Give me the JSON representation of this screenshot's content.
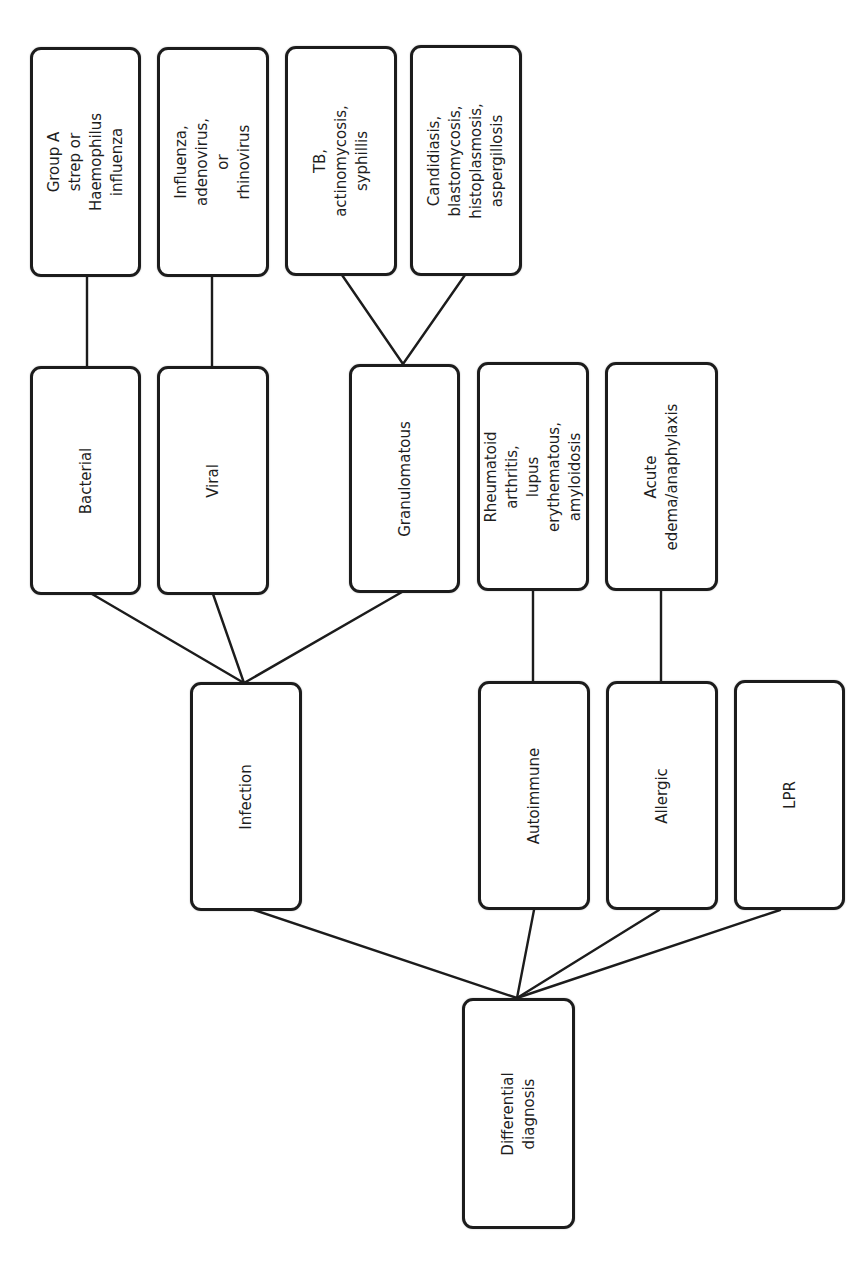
{
  "diagram": {
    "type": "tree",
    "orientation": "rotated 90° counter-clockwise; root at bottom, leaves at top, text reads bottom-to-top",
    "root": {
      "label": "Differential diagnosis",
      "children": [
        {
          "label": "Infection",
          "children": [
            {
              "label": "Bacterial",
              "children": [
                {
                  "label": "Group A strep or\nHaemophilus influenza"
                }
              ]
            },
            {
              "label": "Viral",
              "children": [
                {
                  "label": "Influenza, adenovirus,\nor rhinovirus"
                }
              ]
            },
            {
              "label": "Granulomatous",
              "children": [
                {
                  "label": "TB, actinomycosis,\nsyphillis"
                },
                {
                  "label": "Candidiasis,\nblastomycosis,\nhistoplasmosis,\naspergillosis"
                }
              ]
            }
          ]
        },
        {
          "label": "Autoimmune",
          "children": [
            {
              "label": "Rheumatoid arthritis,\nlupus erythematous,\namyloidosis"
            }
          ]
        },
        {
          "label": "Allergic",
          "children": [
            {
              "label": "Acute\nedema/anaphylaxis"
            }
          ]
        },
        {
          "label": "LPR"
        }
      ]
    }
  },
  "nodes": {
    "root": "Differential diagnosis",
    "infection": "Infection",
    "autoimmune": "Autoimmune",
    "allergic": "Allergic",
    "lpr": "LPR",
    "bacterial": "Bacterial",
    "viral": "Viral",
    "granulomatous": "Granulomatous",
    "bacterial_causes": "Group A strep or\nHaemophilus influenza",
    "viral_causes": "Influenza, adenovirus,\nor rhinovirus",
    "granulomatous_bacterial": "TB, actinomycosis,\nsyphillis",
    "granulomatous_fungal": "Candidiasis,\nblastomycosis,\nhistoplasmosis,\naspergillosis",
    "autoimmune_causes": "Rheumatoid arthritis,\nlupus erythematous,\namyloidosis",
    "allergic_causes": "Acute\nedema/anaphylaxis"
  },
  "colors": {
    "stroke": "#1c1c1c",
    "fill": "#ffffff",
    "text": "#1e1e1e",
    "background": "#ffffff"
  }
}
